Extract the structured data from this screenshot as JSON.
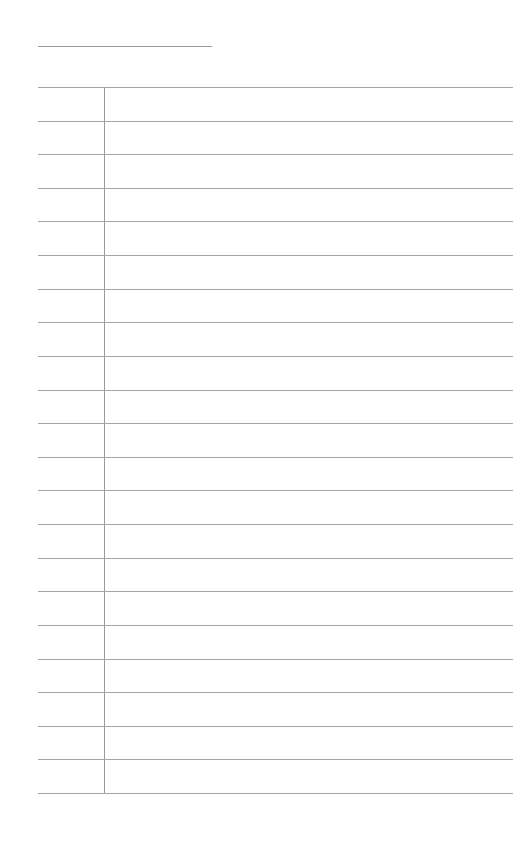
{
  "document": {
    "type": "blank ruled form",
    "title_line": "",
    "columns": [
      "",
      ""
    ],
    "rows": [
      {
        "label": "",
        "value": ""
      },
      {
        "label": "",
        "value": ""
      },
      {
        "label": "",
        "value": ""
      },
      {
        "label": "",
        "value": ""
      },
      {
        "label": "",
        "value": ""
      },
      {
        "label": "",
        "value": ""
      },
      {
        "label": "",
        "value": ""
      },
      {
        "label": "",
        "value": ""
      },
      {
        "label": "",
        "value": ""
      },
      {
        "label": "",
        "value": ""
      },
      {
        "label": "",
        "value": ""
      },
      {
        "label": "",
        "value": ""
      },
      {
        "label": "",
        "value": ""
      },
      {
        "label": "",
        "value": ""
      },
      {
        "label": "",
        "value": ""
      },
      {
        "label": "",
        "value": ""
      },
      {
        "label": "",
        "value": ""
      },
      {
        "label": "",
        "value": ""
      },
      {
        "label": "",
        "value": ""
      },
      {
        "label": "",
        "value": ""
      },
      {
        "label": "",
        "value": ""
      }
    ],
    "line_color": "#a6a6a6",
    "background_color": "#ffffff"
  }
}
